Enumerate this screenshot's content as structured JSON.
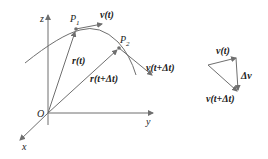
{
  "diagram": {
    "axes": {
      "z": "z",
      "y": "y",
      "x": "x",
      "origin": "O"
    },
    "points": {
      "p1": "P",
      "p1_sub": "1",
      "p2": "P",
      "p2_sub": "2"
    },
    "vectors": {
      "r_t": "r(t)",
      "r_t_dt": "r(t+Δt)",
      "v_t": "v(t)",
      "v_t_dt": "v(t+Δt)"
    },
    "triangle": {
      "v_t": "v(t)",
      "v_t_dt": "v(t+Δt)",
      "delta_v": "Δv"
    },
    "colors": {
      "line": "#6f6f6f",
      "text": "#222222"
    }
  }
}
